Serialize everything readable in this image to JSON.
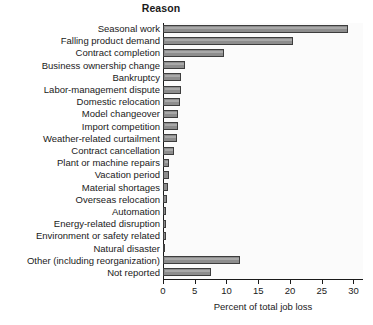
{
  "chart_data": {
    "type": "bar",
    "orientation": "horizontal",
    "title": "Reason",
    "xlabel": "Percent of total job loss",
    "ylabel": "",
    "xlim": [
      0,
      31.5
    ],
    "xticks": [
      0,
      5,
      10,
      15,
      20,
      25,
      30
    ],
    "xtick_labels": [
      "0",
      "5",
      "10",
      "15",
      "20",
      "25",
      "30"
    ],
    "grid": false,
    "legend": null,
    "bar_color": "#8d8d8d",
    "bar_edge_color": "#3d3d3d",
    "plot_background": "#fbfbfb",
    "categories": [
      "Seasonal work",
      "Falling product demand",
      "Contract completion",
      "Business ownership change",
      "Bankruptcy",
      "Labor-management dispute",
      "Domestic relocation",
      "Model changeover",
      "Import competition",
      "Weather-related curtailment",
      "Contract cancellation",
      "Plant or machine repairs",
      "Vacation period",
      "Material shortages",
      "Overseas relocation",
      "Automation",
      "Energy-related disruption",
      "Environment or safety related",
      "Natural disaster",
      "Other (including reorganization)",
      "Not reported"
    ],
    "values": [
      29.1,
      20.4,
      9.6,
      3.4,
      2.8,
      2.9,
      2.6,
      2.4,
      2.4,
      2.2,
      1.7,
      1.0,
      0.9,
      0.8,
      0.6,
      0.5,
      0.4,
      0.4,
      0.3,
      12.1,
      7.5
    ]
  }
}
